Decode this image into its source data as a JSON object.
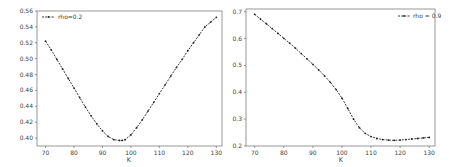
{
  "chart_data": [
    {
      "type": "line",
      "title": "",
      "xlabel": "K",
      "ylabel": "",
      "xlim": [
        67,
        132
      ],
      "ylim": [
        0.39,
        0.56
      ],
      "xticks": [
        70,
        80,
        90,
        100,
        110,
        120,
        130
      ],
      "yticks": [
        0.4,
        0.42,
        0.44,
        0.46,
        0.48,
        0.5,
        0.52,
        0.54,
        0.56
      ],
      "ytick_labels": [
        "0.40",
        "0.42",
        "0.44",
        "0.46",
        "0.48",
        "0.50",
        "0.52",
        "0.54",
        "0.56"
      ],
      "grid": false,
      "legend_position": "upper left",
      "series": [
        {
          "name": "rho=0.2",
          "style": "dashed with dot markers",
          "color": "#222222",
          "x": [
            70,
            72,
            74,
            76,
            78,
            80,
            82,
            84,
            86,
            88,
            90,
            92,
            94,
            96,
            97,
            98,
            100,
            102,
            104,
            106,
            108,
            110,
            112,
            114,
            116,
            118,
            120,
            122,
            124,
            126,
            128,
            130
          ],
          "y": [
            0.522,
            0.511,
            0.499,
            0.487,
            0.475,
            0.463,
            0.451,
            0.439,
            0.428,
            0.418,
            0.409,
            0.402,
            0.398,
            0.397,
            0.397,
            0.398,
            0.404,
            0.413,
            0.423,
            0.434,
            0.445,
            0.456,
            0.467,
            0.478,
            0.489,
            0.499,
            0.51,
            0.52,
            0.53,
            0.54,
            0.546,
            0.552
          ]
        }
      ]
    },
    {
      "type": "line",
      "title": "",
      "xlabel": "K",
      "ylabel": "",
      "xlim": [
        67,
        132
      ],
      "ylim": [
        0.2,
        0.71
      ],
      "xticks": [
        70,
        80,
        90,
        100,
        110,
        120,
        130
      ],
      "yticks": [
        0.2,
        0.3,
        0.4,
        0.5,
        0.6,
        0.7
      ],
      "ytick_labels": [
        "0.2",
        "0.3",
        "0.4",
        "0.5",
        "0.6",
        "0.7"
      ],
      "grid": false,
      "legend_position": "upper right",
      "series": [
        {
          "name": "rho=0.9",
          "style": "dashed with dot markers",
          "color": "#222222",
          "x": [
            70,
            72,
            74,
            76,
            78,
            80,
            82,
            84,
            86,
            88,
            90,
            92,
            94,
            96,
            98,
            100,
            102,
            104,
            106,
            108,
            110,
            112,
            114,
            116,
            118,
            120,
            122,
            124,
            126,
            128,
            130
          ],
          "y": [
            0.69,
            0.672,
            0.655,
            0.637,
            0.619,
            0.601,
            0.583,
            0.564,
            0.544,
            0.524,
            0.504,
            0.483,
            0.461,
            0.437,
            0.41,
            0.378,
            0.34,
            0.3,
            0.268,
            0.247,
            0.235,
            0.228,
            0.224,
            0.222,
            0.221,
            0.222,
            0.224,
            0.226,
            0.228,
            0.23,
            0.232
          ]
        }
      ]
    }
  ],
  "plots": [
    {
      "legend_label": "rho=0.2",
      "xlabel": "K"
    },
    {
      "legend_label": "rho = 0.9",
      "xlabel": "K"
    }
  ]
}
